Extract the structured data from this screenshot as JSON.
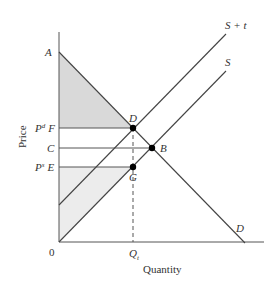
{
  "diagram": {
    "type": "supply-demand-tax",
    "axes": {
      "x_label": "Quantity",
      "y_label": "Price",
      "origin_label": "0"
    },
    "curves": {
      "demand_label": "D",
      "supply_label": "S",
      "supply_tax_label": "S + t"
    },
    "points": {
      "A": "A",
      "D": "D",
      "B": "B",
      "G": "G"
    },
    "price_labels": {
      "F_prefix": "P",
      "F_sup": "d",
      "F": "F",
      "C": "C",
      "E_prefix": "P",
      "E_sup": "s",
      "E": "E"
    },
    "quantity_labels": {
      "Qt_main": "Q",
      "Qt_sub": "t"
    },
    "colors": {
      "line": "#444444",
      "consumer_surplus_fill": "#d9d9d9",
      "producer_surplus_fill": "#ececec",
      "point": "#000000"
    }
  }
}
